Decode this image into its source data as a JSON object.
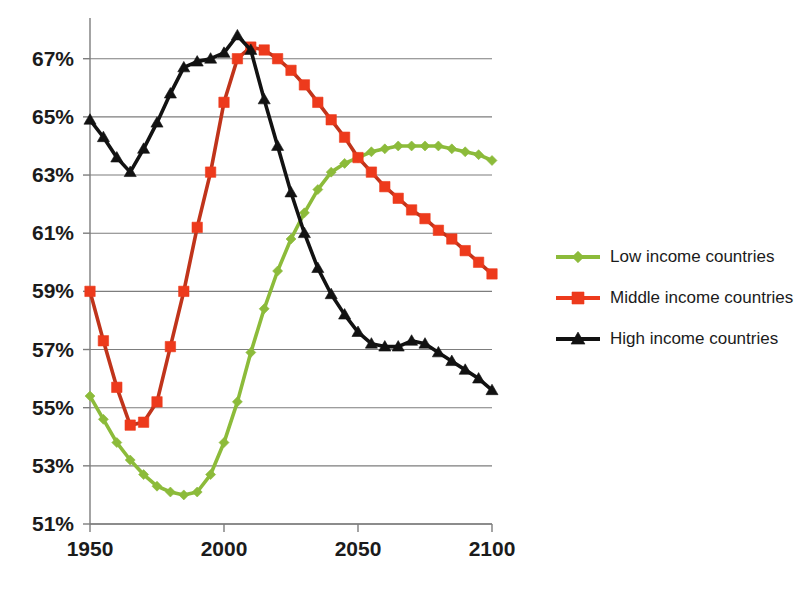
{
  "chart_data": {
    "type": "line",
    "title": "",
    "subtitle": "",
    "xlabel": "",
    "ylabel": "",
    "xlim": [
      1950,
      2100
    ],
    "ylim": [
      51,
      68.4
    ],
    "grid": "horizontal",
    "legend_position": "right",
    "x_ticks": [
      "1950",
      "2000",
      "2050",
      "2100"
    ],
    "x_tick_values": [
      1950,
      2000,
      2050,
      2100
    ],
    "y_ticks": [
      "51%",
      "53%",
      "55%",
      "57%",
      "59%",
      "61%",
      "63%",
      "65%",
      "67%"
    ],
    "y_tick_values": [
      51,
      53,
      55,
      57,
      59,
      61,
      63,
      65,
      67
    ],
    "y_unit": "%",
    "x": [
      1950,
      1955,
      1960,
      1965,
      1970,
      1975,
      1980,
      1985,
      1990,
      1995,
      2000,
      2005,
      2010,
      2015,
      2020,
      2025,
      2030,
      2035,
      2040,
      2045,
      2050,
      2055,
      2060,
      2065,
      2070,
      2075,
      2080,
      2085,
      2090,
      2095,
      2100
    ],
    "series": [
      {
        "name": "Low income countries",
        "marker": "diamond",
        "color": "#8CBB3A",
        "line_color": "#8CBB3A",
        "values": [
          55.4,
          54.6,
          53.8,
          53.2,
          52.7,
          52.3,
          52.1,
          52.0,
          52.1,
          52.7,
          53.8,
          55.2,
          56.9,
          58.4,
          59.7,
          60.8,
          61.7,
          62.5,
          63.1,
          63.4,
          63.6,
          63.8,
          63.9,
          64.0,
          64.0,
          64.0,
          64.0,
          63.9,
          63.8,
          63.7,
          63.5
        ]
      },
      {
        "name": "Middle income countries",
        "marker": "square",
        "color": "#ED3A1C",
        "line_color": "#C0341B",
        "values": [
          59.0,
          57.3,
          55.7,
          54.4,
          54.5,
          55.2,
          57.1,
          59.0,
          61.2,
          63.1,
          65.5,
          67.0,
          67.4,
          67.3,
          67.0,
          66.6,
          66.1,
          65.5,
          64.9,
          64.3,
          63.6,
          63.1,
          62.6,
          62.2,
          61.8,
          61.5,
          61.1,
          60.8,
          60.4,
          60.0,
          59.6
        ]
      },
      {
        "name": "High income countries",
        "marker": "triangle",
        "color": "#121212",
        "line_color": "#121212",
        "values": [
          64.9,
          64.3,
          63.6,
          63.1,
          63.9,
          64.8,
          65.8,
          66.7,
          66.9,
          67.0,
          67.2,
          67.8,
          67.3,
          65.6,
          64.0,
          62.4,
          61.0,
          59.8,
          58.9,
          58.2,
          57.6,
          57.2,
          57.1,
          57.1,
          57.3,
          57.2,
          56.9,
          56.6,
          56.3,
          56.0,
          55.6
        ]
      }
    ],
    "legend": [
      {
        "label": "Low income countries",
        "color": "#8CBB3A",
        "marker": "diamond"
      },
      {
        "label": "Middle income countries",
        "color": "#ED3A1C",
        "marker": "square"
      },
      {
        "label": "High income countries",
        "color": "#121212",
        "marker": "triangle"
      }
    ]
  },
  "colors": {
    "low_income": "#8CBB3A",
    "middle_income": "#ED3A1C",
    "middle_income_line": "#C0341B",
    "high_income": "#121212",
    "gridline": "#7d7d7d",
    "background": "#ffffff",
    "text": "#1b1b1b"
  }
}
